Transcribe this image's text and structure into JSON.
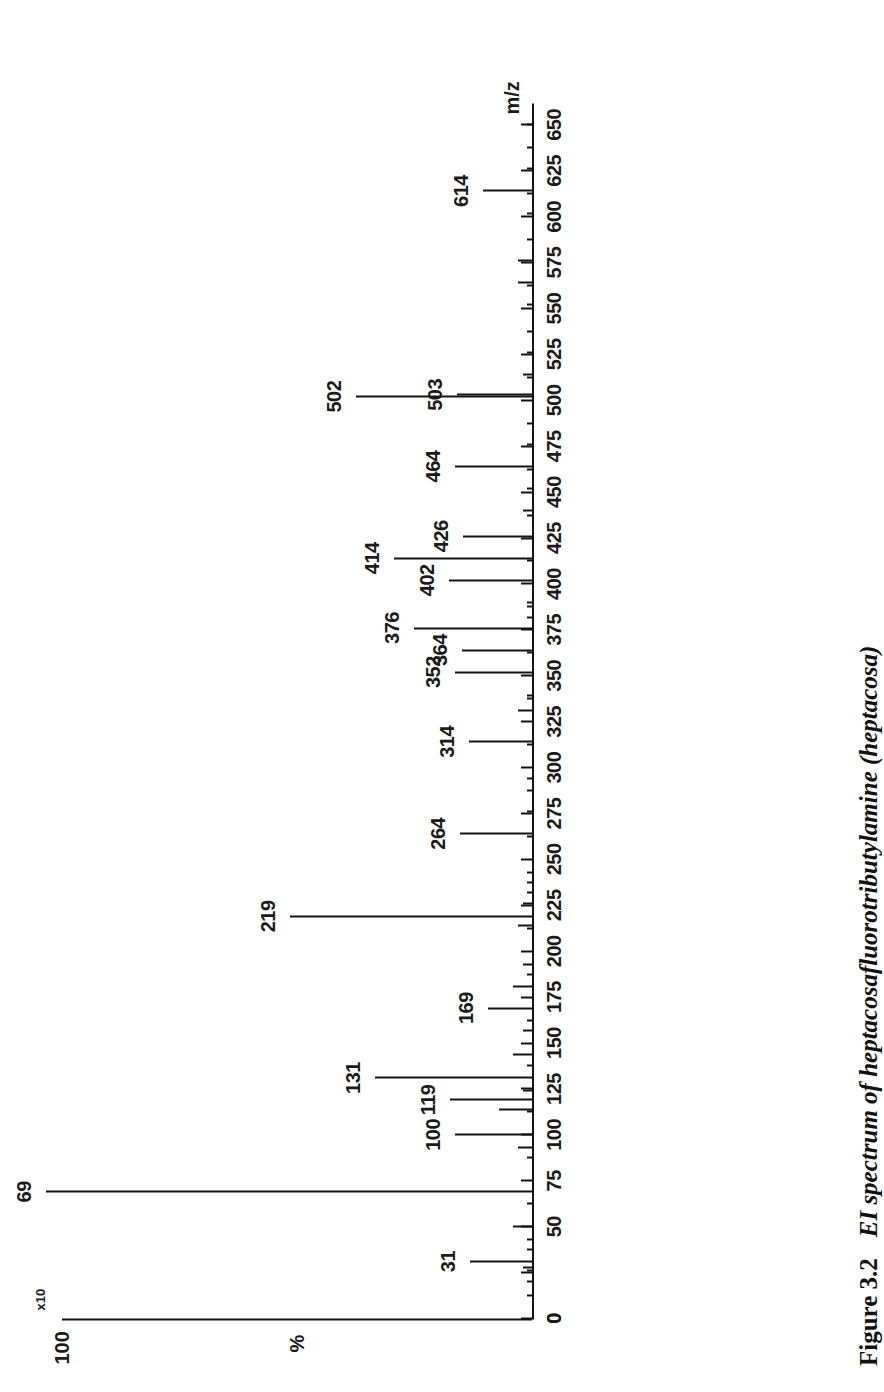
{
  "figure": {
    "number": "Figure 3.2",
    "title_italic": "EI spectrum of heptacosafluorotributylamine (heptacosa)",
    "credit": "(Reproduced with permission from Micromass UK Ltd.)"
  },
  "axes": {
    "x_title": "m/z",
    "y_label_max": "100",
    "y_label_min": "0",
    "y_axis_title": "%",
    "scale_note": "x10"
  },
  "chart_data": {
    "type": "bar",
    "title": "EI spectrum of heptacosafluorotributylamine (heptacosa)",
    "xlabel": "m/z",
    "ylabel": "%",
    "xlim": [
      0,
      660
    ],
    "ylim": [
      0,
      100
    ],
    "grid": false,
    "legend": null,
    "orientation": "rotated-90",
    "x_ticks_major": [
      0,
      25,
      50,
      75,
      100,
      125,
      150,
      175,
      200,
      225,
      250,
      275,
      300,
      325,
      350,
      375,
      400,
      425,
      450,
      475,
      500,
      525,
      550,
      575,
      600,
      625,
      650
    ],
    "x_tick_labels": [
      "0",
      "",
      "50",
      "75",
      "100",
      "125",
      "150",
      "175",
      "200",
      "225",
      "250",
      "275",
      "300",
      "325",
      "350",
      "375",
      "400",
      "425",
      "450",
      "475",
      "500",
      "525",
      "550",
      "575",
      "600",
      "625",
      "650"
    ],
    "labelled_peaks": [
      {
        "mz": 31,
        "intensity": 3,
        "label": "31",
        "leader": true
      },
      {
        "mz": 69,
        "intensity": 100,
        "label": "69",
        "leader": false
      },
      {
        "mz": 100,
        "intensity": 13,
        "label": "100",
        "leader": false
      },
      {
        "mz": 119,
        "intensity": 9,
        "label": "119",
        "leader": false
      },
      {
        "mz": 131,
        "intensity": 30,
        "label": "131",
        "leader": false
      },
      {
        "mz": 169,
        "intensity": 6,
        "label": "169",
        "leader": false
      },
      {
        "mz": 219,
        "intensity": 48,
        "label": "219",
        "leader": false
      },
      {
        "mz": 264,
        "intensity": 12,
        "label": "264",
        "leader": false
      },
      {
        "mz": 314,
        "intensity": 10,
        "label": "314",
        "leader": false
      },
      {
        "mz": 352,
        "intensity": 13,
        "label": "352",
        "leader": false
      },
      {
        "mz": 364,
        "intensity": 6,
        "label": "364",
        "leader": false
      },
      {
        "mz": 376,
        "intensity": 3,
        "label": "376",
        "leader": true
      },
      {
        "mz": 402,
        "intensity": 5,
        "label": "402",
        "leader": false
      },
      {
        "mz": 414,
        "intensity": 26,
        "label": "414",
        "leader": false
      },
      {
        "mz": 426,
        "intensity": 7,
        "label": "426",
        "leader": false
      },
      {
        "mz": 464,
        "intensity": 13,
        "label": "464",
        "leader": false
      },
      {
        "mz": 502,
        "intensity": 34,
        "label": "502",
        "leader": false
      },
      {
        "mz": 503,
        "intensity": 4,
        "label": "503",
        "leader": true
      },
      {
        "mz": 614,
        "intensity": 7,
        "label": "614",
        "leader": false
      }
    ],
    "unlabelled_peaks": [
      {
        "mz": 20,
        "intensity": 1
      },
      {
        "mz": 26,
        "intensity": 1
      },
      {
        "mz": 28,
        "intensity": 2
      },
      {
        "mz": 43,
        "intensity": 1
      },
      {
        "mz": 50,
        "intensity": 4
      },
      {
        "mz": 93,
        "intensity": 3
      },
      {
        "mz": 114,
        "intensity": 7
      },
      {
        "mz": 124,
        "intensity": 2
      },
      {
        "mz": 144,
        "intensity": 4
      },
      {
        "mz": 157,
        "intensity": 2
      },
      {
        "mz": 181,
        "intensity": 4
      },
      {
        "mz": 193,
        "intensity": 2
      },
      {
        "mz": 214,
        "intensity": 3
      },
      {
        "mz": 226,
        "intensity": 2
      },
      {
        "mz": 232,
        "intensity": 1
      },
      {
        "mz": 243,
        "intensity": 1
      },
      {
        "mz": 276,
        "intensity": 1
      },
      {
        "mz": 294,
        "intensity": 1
      },
      {
        "mz": 331,
        "intensity": 3
      },
      {
        "mz": 339,
        "intensity": 1
      },
      {
        "mz": 382,
        "intensity": 1
      },
      {
        "mz": 390,
        "intensity": 1
      },
      {
        "mz": 440,
        "intensity": 2
      },
      {
        "mz": 452,
        "intensity": 1
      },
      {
        "mz": 476,
        "intensity": 1
      },
      {
        "mz": 514,
        "intensity": 2
      },
      {
        "mz": 526,
        "intensity": 1
      },
      {
        "mz": 552,
        "intensity": 1
      },
      {
        "mz": 564,
        "intensity": 3
      },
      {
        "mz": 576,
        "intensity": 3
      },
      {
        "mz": 602,
        "intensity": 1
      },
      {
        "mz": 626,
        "intensity": 1
      },
      {
        "mz": 650,
        "intensity": 1
      }
    ]
  }
}
